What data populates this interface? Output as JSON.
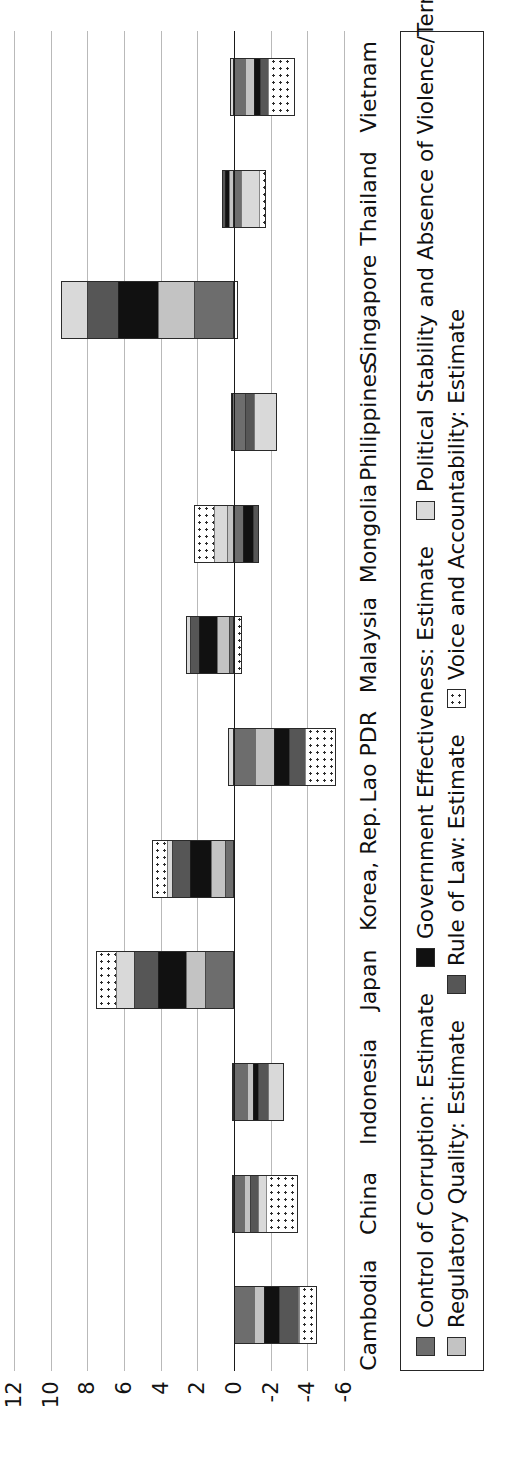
{
  "chart_data": {
    "type": "bar",
    "title": "",
    "subtitle": "",
    "xlabel": "",
    "ylabel": "",
    "stacked": true,
    "orientation": "vertical",
    "grid": true,
    "legend_position": "bottom",
    "ylim": [
      -6,
      12
    ],
    "yticks": [
      "12",
      "10",
      "8",
      "6",
      "4",
      "2",
      "0",
      "-2",
      "-4",
      "-6"
    ],
    "ytick_values": [
      12,
      10,
      8,
      6,
      4,
      2,
      0,
      -2,
      -4,
      -6
    ],
    "categories": [
      "Cambodia",
      "China",
      "Indonesia",
      "Japan",
      "Korea, Rep.",
      "Lao PDR",
      "Malaysia",
      "Mongolia",
      "Philippines",
      "Singapore",
      "Thailand",
      "Vietnam"
    ],
    "series": [
      {
        "name": "Control of Corruption: Estimate",
        "swatch": "dark-grey-solid",
        "color": "#6d6d6d",
        "values": [
          -1.05,
          -0.5,
          -0.7,
          1.55,
          0.45,
          -1.1,
          0.25,
          -0.5,
          -0.6,
          2.15,
          -0.35,
          -0.55
        ]
      },
      {
        "name": "Regulatory Quality: Estimate",
        "swatch": "light-grey-solid",
        "color": "#c3c3c3",
        "values": [
          -0.55,
          -0.35,
          -0.35,
          1.05,
          0.8,
          -1.05,
          0.65,
          0.35,
          0.0,
          2.0,
          0.25,
          -0.55
        ]
      },
      {
        "name": "Government Effectiveness: Estimate",
        "swatch": "black-solid",
        "color": "#111111",
        "values": [
          -0.85,
          0.1,
          -0.25,
          1.55,
          1.15,
          -0.85,
          1.05,
          -0.55,
          0.05,
          2.2,
          0.25,
          -0.3
        ]
      },
      {
        "name": "Rule of Law: Estimate",
        "swatch": "mid-grey-solid",
        "color": "#565656",
        "values": [
          -1.05,
          -0.45,
          -0.6,
          1.35,
          1.0,
          -0.9,
          0.5,
          -0.3,
          -0.5,
          1.7,
          0.15,
          -0.45
        ]
      },
      {
        "name": "Political Stability and Absence of Violence/Terrorism: Estimate",
        "swatch": "pale-grey-solid",
        "color": "#d9d9d9",
        "values": [
          -0.1,
          -0.45,
          -0.85,
          1.0,
          0.3,
          0.35,
          0.15,
          0.75,
          -1.25,
          1.4,
          -1.05,
          0.2
        ]
      },
      {
        "name": "Voice and Accountability: Estimate",
        "swatch": "white-dotted",
        "color": "#ffffff",
        "values": [
          -0.95,
          -1.75,
          0.1,
          1.05,
          0.75,
          -1.65,
          -0.45,
          1.1,
          0.1,
          -0.2,
          -0.35,
          -1.45
        ]
      }
    ],
    "totals": [
      -4.55,
      -3.4,
      -2.65,
      7.55,
      4.45,
      -5.2,
      2.15,
      0.85,
      -2.2,
      9.25,
      -1.1,
      -3.1
    ]
  },
  "axis": {
    "value_axis_ticks": [
      "12",
      "10",
      "8",
      "6",
      "4",
      "2",
      "0",
      "-2",
      "-4",
      "-6"
    ]
  },
  "legend": {
    "items": [
      {
        "label": "Control of Corruption: Estimate",
        "swatch_class": "s0"
      },
      {
        "label": "Government Effectiveness: Estimate",
        "swatch_class": "s2"
      },
      {
        "label": "Political Stability and Absence of Violence/Terrorism: Estimate",
        "swatch_class": "s4"
      },
      {
        "label": "Regulatory Quality: Estimate",
        "swatch_class": "s1"
      },
      {
        "label": "Rule of Law: Estimate",
        "swatch_class": "s3"
      },
      {
        "label": "Voice and Accountability: Estimate",
        "swatch_class": "s5"
      }
    ]
  }
}
